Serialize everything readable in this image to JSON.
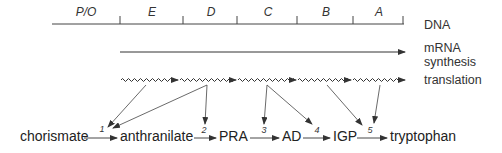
{
  "labels": {
    "dna": "DNA",
    "mrna_1": "mRNA",
    "mrna_2": "synthesis",
    "translation": "translation"
  },
  "genes": [
    {
      "name": "P/O",
      "x": 86
    },
    {
      "name": "E",
      "x": 152
    },
    {
      "name": "D",
      "x": 211
    },
    {
      "name": "C",
      "x": 268
    },
    {
      "name": "B",
      "x": 326
    },
    {
      "name": "A",
      "x": 379
    }
  ],
  "pathway": {
    "compounds": [
      "chorismate",
      "anthranilate",
      "PRA",
      "AD",
      "IGP",
      "tryptophan"
    ],
    "steps": [
      "1",
      "2",
      "3",
      "4",
      "5"
    ]
  },
  "colors": {
    "line": "#333333",
    "text": "#222222",
    "background": "#ffffff"
  }
}
